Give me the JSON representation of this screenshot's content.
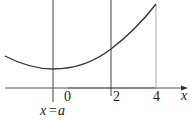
{
  "figure": {
    "type": "function-graph",
    "axis": {
      "x_label": "x",
      "ticks": [
        {
          "value": "0",
          "label": "0"
        },
        {
          "value": "2",
          "label": "2"
        },
        {
          "value": "4",
          "label": "4"
        }
      ]
    },
    "vertical_lines": [
      {
        "label": "x = a",
        "position": "a"
      },
      {
        "label": "",
        "position": "2"
      },
      {
        "label": "",
        "position": "4"
      }
    ],
    "labels": {
      "origin": "0",
      "tick2": "2",
      "tick4": "4",
      "axis_x": "x",
      "xa_left": "x",
      "xa_eq": "=",
      "xa_right": "a"
    },
    "colors": {
      "curve": "#333333",
      "axis": "#555555",
      "guide_dark": "#444444",
      "guide_light": "#aaaaaa",
      "highlight_segment": "#888888"
    }
  }
}
